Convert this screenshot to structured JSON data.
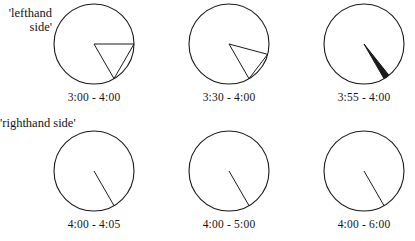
{
  "figure": {
    "title_present": false,
    "background_color": "#ffffff",
    "stroke_color": "#1a1a1a",
    "side_labels": [
      {
        "id": "lefthand-side",
        "text": "'lefthand\nside'"
      },
      {
        "id": "righthand-side",
        "text": "'righthand side'"
      }
    ],
    "clocks": [
      {
        "id": "clock-3-00-to-4-00",
        "caption": "3:00 - 4:00",
        "start_time": "3:00",
        "end_time": "4:00",
        "start_angle_deg": 90,
        "end_angle_deg": 120,
        "sweep_deg": 30,
        "hand_style": "wedge"
      },
      {
        "id": "clock-3-30-to-4-00",
        "caption": "3:30 - 4:00",
        "start_time": "3:30",
        "end_time": "4:00",
        "start_angle_deg": 105,
        "end_angle_deg": 120,
        "sweep_deg": 15,
        "hand_style": "wedge"
      },
      {
        "id": "clock-3-55-to-4-00",
        "caption": "3:55 - 4:00",
        "start_time": "3:55",
        "end_time": "4:00",
        "start_angle_deg": 117.5,
        "end_angle_deg": 120,
        "sweep_deg": 2.5,
        "hand_style": "wedge-thick"
      },
      {
        "id": "clock-4-00-to-4-05",
        "caption": "4:00 - 4:05",
        "start_time": "4:00",
        "end_time": "4:05",
        "start_angle_deg": 120,
        "end_angle_deg": 122.5,
        "sweep_deg": 2.5,
        "hand_style": "line"
      },
      {
        "id": "clock-4-00-to-5-00",
        "caption": "4:00 - 5:00",
        "start_time": "4:00",
        "end_time": "5:00",
        "start_angle_deg": 120,
        "end_angle_deg": 150,
        "sweep_deg": 30,
        "hand_style": "line"
      },
      {
        "id": "clock-4-00-to-6-00",
        "caption": "4:00 - 6:00",
        "start_time": "4:00",
        "end_time": "6:00",
        "start_angle_deg": 120,
        "end_angle_deg": 180,
        "sweep_deg": 60,
        "hand_style": "line"
      }
    ]
  }
}
